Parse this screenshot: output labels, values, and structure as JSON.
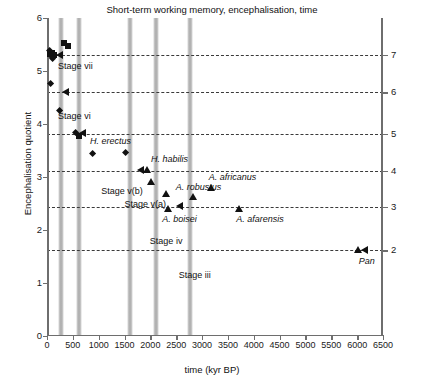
{
  "chart_data": {
    "type": "scatter",
    "title": "Short-term working memory, encephalisation, time",
    "xlabel": "time (kyr BP)",
    "ylabel": "Encephalisation quotient",
    "y2label": "Short-term working memory",
    "xlim": [
      0,
      6500
    ],
    "ylim": [
      0,
      6
    ],
    "y2lim": [
      1.6,
      7.0
    ],
    "grid": false,
    "legend": "none",
    "xticks": [
      0,
      500,
      1000,
      1500,
      2000,
      2500,
      3000,
      3500,
      4000,
      4500,
      5000,
      5500,
      6000,
      6500
    ],
    "xticklabels": [
      "0",
      "500",
      "1000",
      "1500",
      "2000",
      "2500",
      "3000",
      "3500",
      "4000",
      "4500",
      "5000",
      "5500",
      "6000",
      "6500"
    ],
    "yticks": [
      0,
      1,
      2,
      3,
      4,
      5,
      6
    ],
    "yticklabels": [
      "0",
      "1",
      "2",
      "3",
      "4",
      "5",
      "6"
    ],
    "y2ticks": [
      2,
      3,
      4,
      5,
      6,
      7
    ],
    "y2ticklabels": [
      "2",
      "3",
      "4",
      "5",
      "6",
      "7"
    ],
    "guide_lines": [
      {
        "stm": 7,
        "eq": 5.3
      },
      {
        "stm": 6,
        "eq": 4.6
      },
      {
        "stm": 5,
        "eq": 3.82
      },
      {
        "stm": 4,
        "eq": 3.12
      },
      {
        "stm": 3,
        "eq": 2.44
      },
      {
        "stm": 2,
        "eq": 1.62
      }
    ],
    "stage_bands": [
      {
        "label": "Stage vii",
        "center_kyr": 270,
        "width_kyr": 105
      },
      {
        "label": "Stage vi",
        "center_kyr": 620,
        "width_kyr": 105
      },
      {
        "label": "Stage v(b)",
        "center_kyr": 1600,
        "width_kyr": 105
      },
      {
        "label": "Stage v(a)",
        "center_kyr": 2110,
        "width_kyr": 105
      },
      {
        "label": "Stage iv",
        "center_kyr": 2760,
        "width_kyr": 105
      },
      {
        "label": "Stage iii",
        "center_kyr": 2760,
        "width_kyr": 105
      }
    ],
    "series": [
      {
        "name": "modern/archaic Homo (squares)",
        "marker": "square",
        "points": [
          {
            "x": 60,
            "y": 5.32
          },
          {
            "x": 95,
            "y": 5.34
          },
          {
            "x": 130,
            "y": 5.3
          },
          {
            "x": 330,
            "y": 5.52
          },
          {
            "x": 400,
            "y": 5.48
          },
          {
            "x": 620,
            "y": 3.78
          }
        ]
      },
      {
        "name": "Homo (diamonds)",
        "marker": "diamond",
        "points": [
          {
            "x": 50,
            "y": 5.38
          },
          {
            "x": 75,
            "y": 5.3
          },
          {
            "x": 110,
            "y": 5.24
          },
          {
            "x": 60,
            "y": 4.76
          },
          {
            "x": 250,
            "y": 4.26
          },
          {
            "x": 560,
            "y": 3.84
          },
          {
            "x": 880,
            "y": 3.45
          },
          {
            "x": 1520,
            "y": 3.46
          }
        ]
      },
      {
        "name": "australopithecines / early Homo (triangles)",
        "marker": "triangle",
        "points": [
          {
            "x": 1930,
            "y": 3.12
          },
          {
            "x": 2020,
            "y": 2.9
          },
          {
            "x": 2300,
            "y": 2.68
          },
          {
            "x": 2350,
            "y": 2.4
          },
          {
            "x": 2830,
            "y": 2.62
          },
          {
            "x": 3170,
            "y": 2.78
          },
          {
            "x": 3720,
            "y": 2.4
          },
          {
            "x": 6020,
            "y": 1.62
          }
        ]
      }
    ],
    "guide_arrows": [
      {
        "x_kyr": 330,
        "eq": 5.3
      },
      {
        "x_kyr": 430,
        "eq": 4.6
      },
      {
        "x_kyr": 760,
        "eq": 3.82
      },
      {
        "x_kyr": 1880,
        "eq": 3.12
      },
      {
        "x_kyr": 2640,
        "eq": 2.44
      },
      {
        "x_kyr": 6220,
        "eq": 1.62
      }
    ],
    "annotations": [
      {
        "text": "Stage vii",
        "x_kyr": 215,
        "eq": 5.08,
        "italic": false
      },
      {
        "text": "Stage vi",
        "x_kyr": 215,
        "eq": 4.14,
        "italic": false
      },
      {
        "text": "H. erectus",
        "x_kyr": 830,
        "eq": 3.66,
        "italic": true
      },
      {
        "text": "H. habilis",
        "x_kyr": 2010,
        "eq": 3.32,
        "italic": true
      },
      {
        "text": "A. africanus",
        "x_kyr": 3130,
        "eq": 2.98,
        "italic": true
      },
      {
        "text": "A. robustus",
        "x_kyr": 2490,
        "eq": 2.79,
        "italic": true
      },
      {
        "text": "A. boisei",
        "x_kyr": 2230,
        "eq": 2.18,
        "italic": true
      },
      {
        "text": "A. afarensis",
        "x_kyr": 3660,
        "eq": 2.18,
        "italic": true
      },
      {
        "text": "Pan",
        "x_kyr": 6030,
        "eq": 1.39,
        "italic": true
      },
      {
        "text": "Stage v(b)",
        "x_kyr": 1050,
        "eq": 2.72,
        "italic": false
      },
      {
        "text": "Stage v(a)",
        "x_kyr": 1500,
        "eq": 2.48,
        "italic": false
      },
      {
        "text": "Stage iv",
        "x_kyr": 1990,
        "eq": 1.78,
        "italic": false
      },
      {
        "text": "Stage iii",
        "x_kyr": 2550,
        "eq": 1.14,
        "italic": false
      }
    ]
  }
}
